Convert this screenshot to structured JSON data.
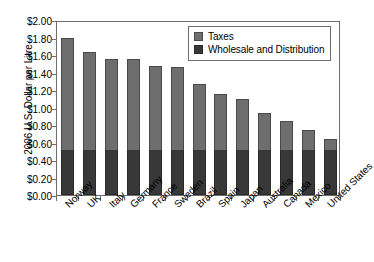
{
  "chart_data": {
    "type": "bar",
    "subtype": "stacked-bar",
    "title": "",
    "xlabel": "",
    "ylabel": "2006 U.S. Dollar per Litre",
    "ylim": [
      0,
      2.0
    ],
    "ytick_step": 0.2,
    "ytick_labels": [
      "$0.00",
      "$0.20",
      "$0.40",
      "$0.60",
      "$0.80",
      "$1.00",
      "$1.20",
      "$1.40",
      "$1.60",
      "$1.80",
      "$2.00"
    ],
    "ytick_values": [
      0,
      0.2,
      0.4,
      0.6,
      0.8,
      1.0,
      1.2,
      1.4,
      1.6,
      1.8,
      2.0
    ],
    "grid": false,
    "legend_position": "top-right",
    "categories": [
      "Norway",
      "UK",
      "Italy",
      "Germany",
      "France",
      "Sweden",
      "Brazil",
      "Spain",
      "Japan",
      "Australia",
      "Canada",
      "Mexico",
      "United States"
    ],
    "series": [
      {
        "name": "Wholesale and Distribution",
        "color": "#383838",
        "values": [
          0.52,
          0.52,
          0.52,
          0.52,
          0.52,
          0.52,
          0.52,
          0.52,
          0.52,
          0.52,
          0.52,
          0.52,
          0.52
        ]
      },
      {
        "name": "Taxes",
        "color": "#6e6e6e",
        "values": [
          1.28,
          1.11,
          1.04,
          1.03,
          0.96,
          0.94,
          0.75,
          0.64,
          0.58,
          0.42,
          0.33,
          0.22,
          0.12
        ]
      }
    ],
    "totals": [
      1.8,
      1.63,
      1.56,
      1.55,
      1.48,
      1.46,
      1.27,
      1.16,
      1.1,
      0.94,
      0.85,
      0.74,
      0.64
    ]
  },
  "legend": {
    "entries": [
      {
        "label": "Taxes",
        "swatch": "taxes"
      },
      {
        "label": "Wholesale and Distribution",
        "swatch": "wholesale"
      }
    ]
  }
}
